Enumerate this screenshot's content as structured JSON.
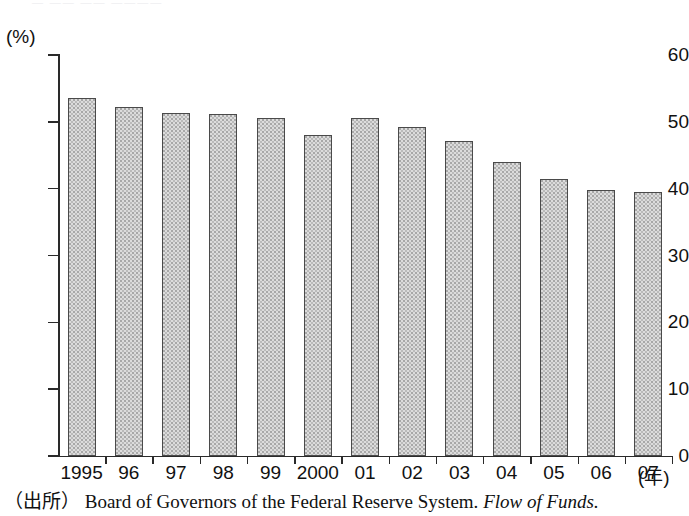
{
  "clipped_header_text": "—  ——  ——   ————",
  "axis": {
    "y_unit_label": "(%)",
    "x_unit_label": "(年)",
    "y_ticks": [
      "0",
      "10",
      "20",
      "30",
      "40",
      "50",
      "60"
    ],
    "ylim": [
      0,
      60
    ]
  },
  "source": {
    "tag": "（出所）",
    "body": "Board of Governors of the Federal Reserve System.",
    "publication": "Flow of Funds."
  },
  "chart_data": {
    "type": "bar",
    "title": "",
    "xlabel": "(年)",
    "ylabel": "(%)",
    "ylim": [
      0,
      60
    ],
    "yticks": [
      0,
      10,
      20,
      30,
      40,
      50,
      60
    ],
    "grid": false,
    "legend": "none",
    "categories": [
      "1995",
      "96",
      "97",
      "98",
      "99",
      "2000",
      "01",
      "02",
      "03",
      "04",
      "05",
      "06",
      "07"
    ],
    "values": [
      53.5,
      52.2,
      51.3,
      51.2,
      50.6,
      48.0,
      50.6,
      49.3,
      47.2,
      44.0,
      41.4,
      39.8,
      39.5
    ],
    "bar_fill_color": "#dcdcdc",
    "bar_border_color": "#4a4a4a",
    "axis_color": "#2a2a2a"
  }
}
